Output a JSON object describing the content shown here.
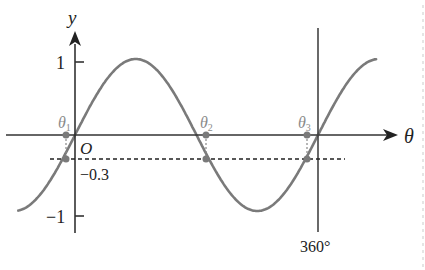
{
  "chart_data": {
    "type": "line",
    "title": "",
    "function": "y = sin(theta)",
    "xlabel": "θ",
    "ylabel": "y",
    "origin_label": "O",
    "x_range_deg": [
      -60,
      390
    ],
    "ylim": [
      -1,
      1
    ],
    "x_tick_labels": [
      "360°"
    ],
    "y_tick_labels": [
      "1",
      "-1",
      "-0.3"
    ],
    "reference_line": {
      "y": -0.3,
      "style": "dashed",
      "label": "-0.3"
    },
    "solutions": [
      {
        "label": "θ",
        "subscript": "1",
        "x_deg": -17.5
      },
      {
        "label": "θ",
        "subscript": "2",
        "x_deg": 197.5
      },
      {
        "label": "θ",
        "subscript": "3",
        "x_deg": 342.5
      }
    ],
    "vertical_line_at_deg": 360,
    "series": [
      {
        "name": "sin θ",
        "color": "#7a7a7a"
      }
    ],
    "grid": false,
    "legend": null
  },
  "labels": {
    "y_axis": "y",
    "x_axis": "θ",
    "origin": "O",
    "one": "1",
    "minus_one": "−1",
    "minus_point_three": "−0.3",
    "deg360": "360°",
    "theta": "θ",
    "sub1": "1",
    "sub2": "2",
    "sub3": "3"
  }
}
